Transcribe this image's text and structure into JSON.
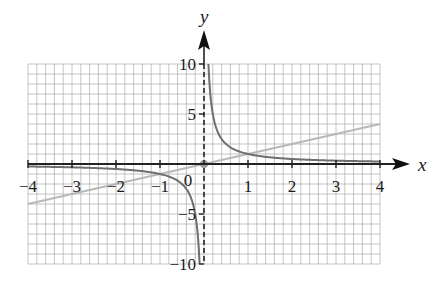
{
  "chart_data": {
    "type": "line",
    "title": "",
    "xlabel": "x",
    "ylabel": "y",
    "xlim": [
      -4,
      4
    ],
    "ylim": [
      -10,
      10
    ],
    "grid": true,
    "grid_minor_x_step": 0.2,
    "grid_minor_y_step": 1,
    "x_ticks": [
      -4,
      -3,
      -2,
      -1,
      0,
      1,
      2,
      3,
      4
    ],
    "x_tick_labels": [
      "−4",
      "−3",
      "−2",
      "−1",
      "0",
      "1",
      "2",
      "3",
      "4"
    ],
    "y_ticks": [
      -10,
      -5,
      5,
      10
    ],
    "y_tick_labels": [
      "−10",
      "−5",
      "5",
      "10"
    ],
    "series": [
      {
        "name": "y = 1/x",
        "color": "#6e6e6e",
        "style": "solid",
        "x": [
          -4,
          -3,
          -2,
          -1,
          -0.5,
          -0.25,
          -0.1,
          0.1,
          0.25,
          0.5,
          1,
          2,
          3,
          4
        ],
        "values": [
          -0.25,
          -0.333,
          -0.5,
          -1,
          -2,
          -4,
          -10,
          10,
          4,
          2,
          1,
          0.5,
          0.333,
          0.25
        ]
      },
      {
        "name": "y = x",
        "color": "#b8b8b8",
        "style": "solid",
        "x": [
          -4,
          4
        ],
        "values": [
          -4,
          4
        ]
      }
    ],
    "annotations": [
      {
        "type": "point",
        "x": 0,
        "y": 0,
        "color": "#9a9a9a",
        "label": "origin"
      },
      {
        "type": "asymptote",
        "orientation": "vertical",
        "x": 0,
        "style": "dashed"
      }
    ]
  },
  "labels": {
    "x_axis": "x",
    "y_axis": "y",
    "origin": "0"
  }
}
